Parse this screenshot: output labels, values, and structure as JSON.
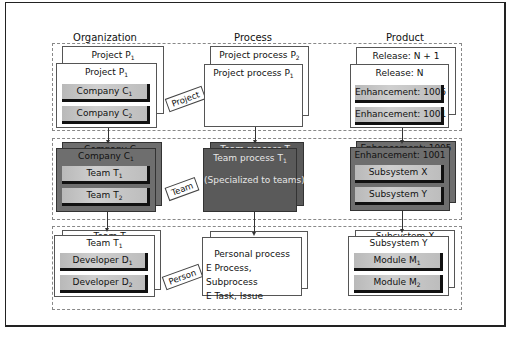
{
  "columns": {
    "organization": "Organization",
    "process": "Process",
    "product": "Product"
  },
  "rows": {
    "project": {
      "tag": "Project",
      "organization": {
        "back_title": "Project P",
        "back_sub": "1",
        "front_title": "Project P",
        "front_sub": "1",
        "items": [
          {
            "label": "Company C",
            "sub": "1"
          },
          {
            "label": "Company C",
            "sub": "2"
          }
        ]
      },
      "process": {
        "back_title": "Project process P",
        "back_sub": "2",
        "front_title": "Project process P",
        "front_sub": "1"
      },
      "product": {
        "back_title": "Release:  N + 1",
        "front_title": "Release:  N",
        "items": [
          {
            "label": "Enhancement: 1005"
          },
          {
            "label": "Enhancement: 1001"
          }
        ]
      }
    },
    "team": {
      "tag": "Team",
      "organization": {
        "back_title": "Company C",
        "back_sub": "2",
        "front_title": "Company C",
        "front_sub": "1",
        "items": [
          {
            "label": "Team T",
            "sub": "1"
          },
          {
            "label": "Team T",
            "sub": "2"
          }
        ]
      },
      "process": {
        "back_title": "Team process T",
        "back_sub": "2",
        "front_title": "Team process T",
        "front_sub": "1",
        "front_note": "(Specialized to teams)"
      },
      "product": {
        "back_title": "Enhancement: 1005",
        "front_title": "Enhancement: 1001",
        "items": [
          {
            "label": "Subsystem X"
          },
          {
            "label": "Subsystem Y"
          }
        ]
      }
    },
    "person": {
      "tag": "Person",
      "organization": {
        "back_title": "Team T",
        "back_sub": "2",
        "front_title": "Team T",
        "front_sub": "1",
        "items": [
          {
            "label": "Developer D",
            "sub": "1"
          },
          {
            "label": "Developer D",
            "sub": "2"
          }
        ]
      },
      "process": {
        "lines": [
          "Personal process",
          "E Process, Subprocess",
          "E Task, Issue"
        ]
      },
      "product": {
        "back_title": "Subsystem X",
        "front_title": "Subsystem Y",
        "items": [
          {
            "label": "Module M",
            "sub": "1"
          },
          {
            "label": "Module M",
            "sub": "2"
          }
        ]
      }
    }
  }
}
